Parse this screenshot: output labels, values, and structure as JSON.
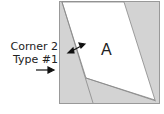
{
  "diagram": {
    "piece_label": "A",
    "annotation_line1": "Corner 2",
    "annotation_line2": "Type #1",
    "colors": {
      "fill_gray": "#d3d3d3",
      "fill_white": "#ffffff",
      "stroke": "#888888",
      "text": "#222222"
    }
  }
}
